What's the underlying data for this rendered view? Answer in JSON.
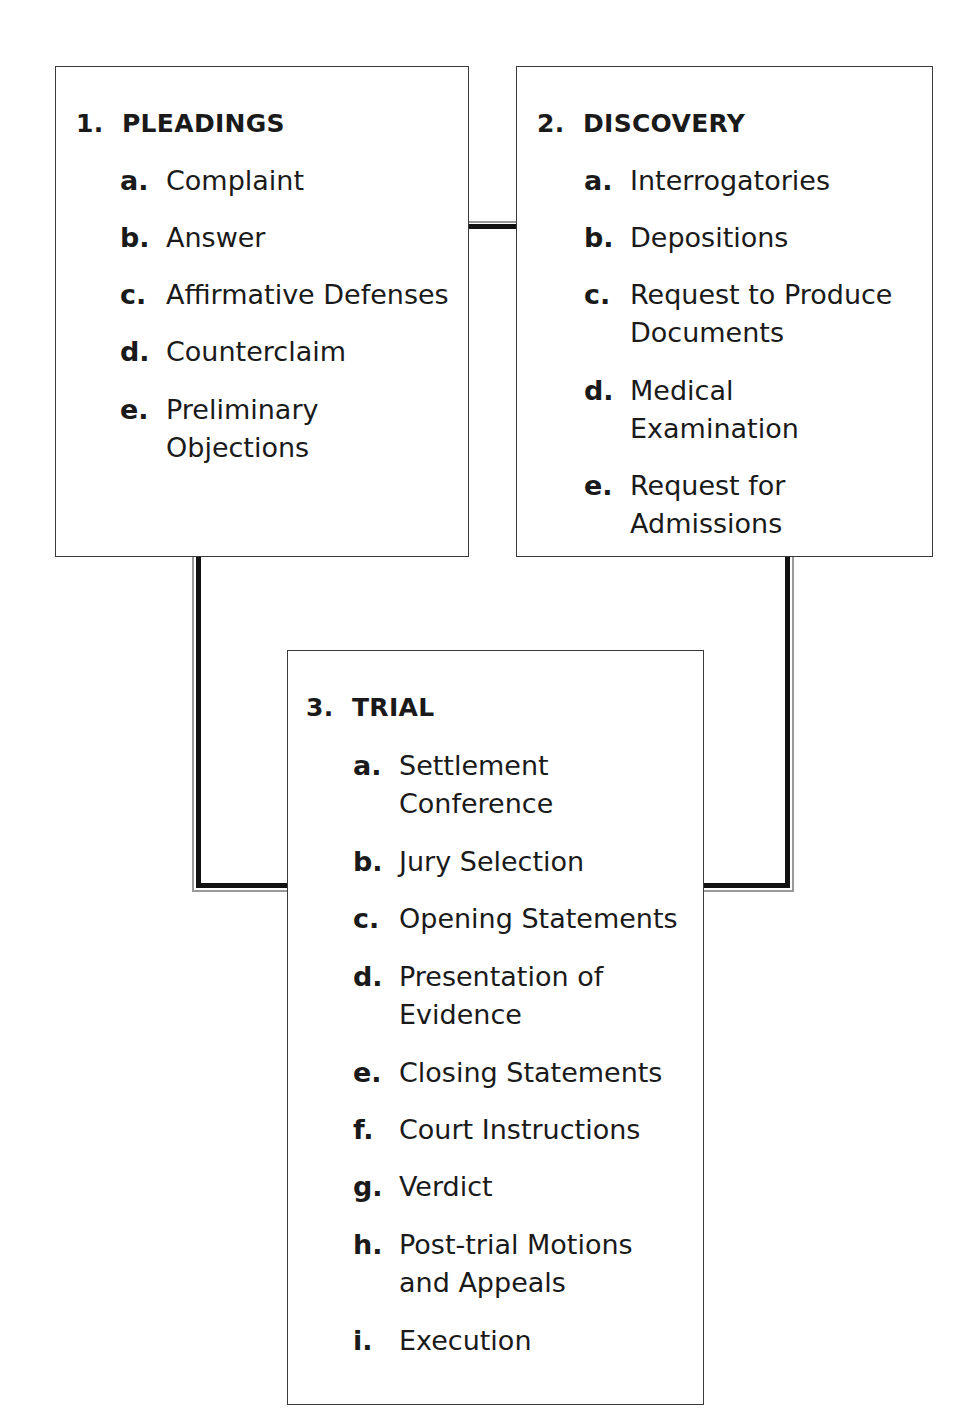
{
  "diagram": {
    "boxes": [
      {
        "number": "1.",
        "title": "PLEADINGS",
        "items": [
          {
            "letter": "a.",
            "text": [
              "Complaint"
            ]
          },
          {
            "letter": "b.",
            "text": [
              "Answer"
            ]
          },
          {
            "letter": "c.",
            "text": [
              "Affirmative Defenses"
            ]
          },
          {
            "letter": "d.",
            "text": [
              "Counterclaim"
            ]
          },
          {
            "letter": "e.",
            "text": [
              "Preliminary",
              "Objections"
            ]
          }
        ]
      },
      {
        "number": "2.",
        "title": "DISCOVERY",
        "items": [
          {
            "letter": "a.",
            "text": [
              "Interrogatories"
            ]
          },
          {
            "letter": "b.",
            "text": [
              "Depositions"
            ]
          },
          {
            "letter": "c.",
            "text": [
              "Request to Produce",
              "Documents"
            ]
          },
          {
            "letter": "d.",
            "text": [
              "Medical",
              "Examination"
            ]
          },
          {
            "letter": "e.",
            "text": [
              "Request for",
              "Admissions"
            ]
          }
        ]
      },
      {
        "number": "3.",
        "title": "TRIAL",
        "items": [
          {
            "letter": "a.",
            "text": [
              "Settlement",
              "Conference"
            ]
          },
          {
            "letter": "b.",
            "text": [
              "Jury Selection"
            ]
          },
          {
            "letter": "c.",
            "text": [
              "Opening Statements"
            ]
          },
          {
            "letter": "d.",
            "text": [
              "Presentation of",
              "Evidence"
            ]
          },
          {
            "letter": "e.",
            "text": [
              "Closing Statements"
            ]
          },
          {
            "letter": "f.",
            "text": [
              "Court Instructions"
            ]
          },
          {
            "letter": "g.",
            "text": [
              "Verdict"
            ]
          },
          {
            "letter": "h.",
            "text": [
              "Post-trial Motions",
              "and Appeals"
            ]
          },
          {
            "letter": "i.",
            "text": [
              "Execution"
            ]
          }
        ]
      }
    ],
    "colors": {
      "line": "#111111",
      "border": "#3a3a3a",
      "background": "#ffffff"
    }
  }
}
